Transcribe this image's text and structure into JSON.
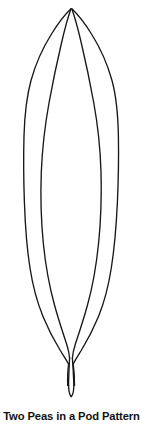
{
  "document": {
    "title": "Two Peas in a Pod Pattern",
    "background_color": "#ffffff",
    "width": 143,
    "height": 433
  },
  "figure": {
    "name": "two-peas-in-a-pod-outline",
    "stroke_color": "#181818",
    "fill_color": "none",
    "stroke_width": 1.35,
    "apex": {
      "x": 71,
      "y": 8
    },
    "stem_tip": {
      "x": 71,
      "y": 397
    },
    "outer_left_extent": 24,
    "outer_right_extent": 118,
    "inner_left_extent": 41,
    "inner_right_extent": 99,
    "widest_y": 200
  },
  "caption": {
    "text": "Two Peas in a Pod Pattern",
    "color": "#111111"
  }
}
